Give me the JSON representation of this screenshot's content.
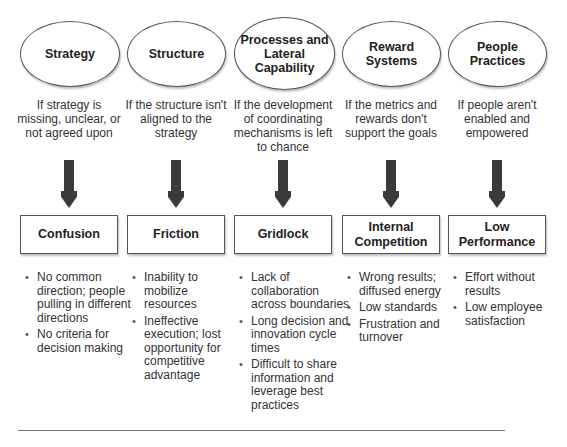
{
  "columns": [
    {
      "factor": "Strategy",
      "condition": "If strategy is missing, unclear, or not agreed upon",
      "outcome": "Confusion",
      "effects": [
        "No common direction; people pulling in different directions",
        "No criteria for decision making"
      ]
    },
    {
      "factor": "Structure",
      "condition": "If the structure isn't aligned to the strategy",
      "outcome": "Friction",
      "effects": [
        "Inability to mobilize resources",
        "Ineffective execution; lost opportunity for competitive advantage"
      ]
    },
    {
      "factor": "Processes and Lateral Capability",
      "condition": "If the development of coordinating mechanisms is left to chance",
      "outcome": "Gridlock",
      "effects": [
        "Lack of collaboration across boundaries",
        "Long decision and innovation cycle times",
        "Difficult to share information and leverage best practices"
      ]
    },
    {
      "factor": "Reward Systems",
      "condition": "If the metrics and rewards don't support the goals",
      "outcome": "Internal Competition",
      "effects": [
        "Wrong results; diffused energy",
        "Low standards",
        "Frustration and turnover"
      ]
    },
    {
      "factor": "People Practices",
      "condition": "If people aren't enabled and empowered",
      "outcome": "Low Performance",
      "effects": [
        "Effort without results",
        "Low employee satisfaction"
      ]
    }
  ],
  "colors": {
    "arrow": "#3a3a3a",
    "border": "#555555",
    "text": "#2a2a2a",
    "rule": "#777777"
  }
}
